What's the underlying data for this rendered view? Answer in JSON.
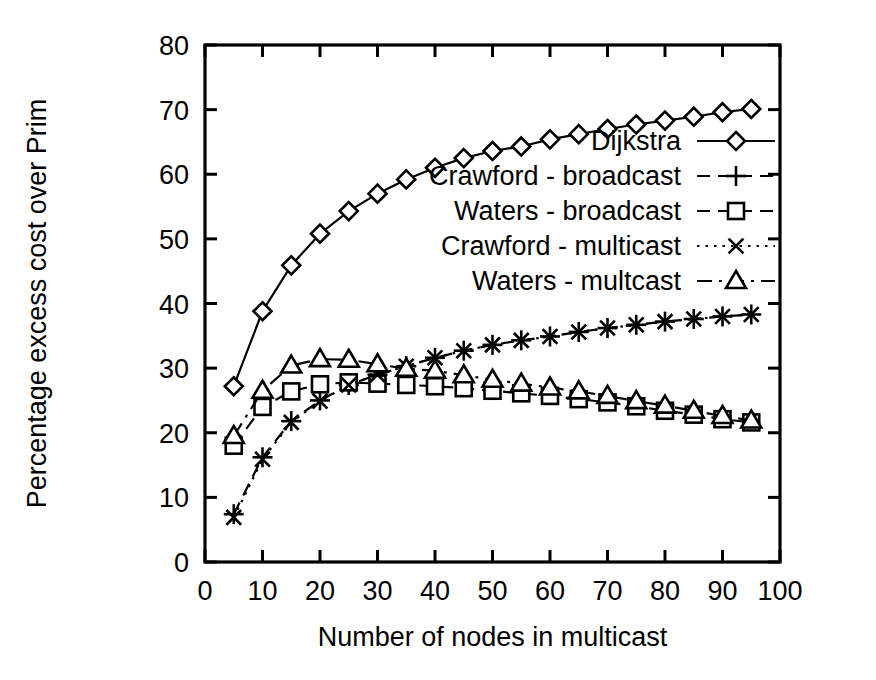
{
  "chart_data": {
    "type": "line",
    "title": "",
    "subtitle": "",
    "xlabel": "Number of nodes in multicast",
    "ylabel": "Percentage excess cost over Prim",
    "xlim": [
      0,
      100
    ],
    "ylim": [
      0,
      80
    ],
    "xticks": [
      0,
      10,
      20,
      30,
      40,
      50,
      60,
      70,
      80,
      90,
      100
    ],
    "yticks": [
      0,
      10,
      20,
      30,
      40,
      50,
      60,
      70,
      80
    ],
    "xtick_labels": [
      "0",
      "10",
      "20",
      "30",
      "40",
      "50",
      "60",
      "70",
      "80",
      "90",
      "100"
    ],
    "ytick_labels": [
      "0",
      "10",
      "20",
      "30",
      "40",
      "50",
      "60",
      "70",
      "80"
    ],
    "grid": false,
    "legend_position": "upper-right-inside",
    "x": [
      5,
      10,
      15,
      20,
      25,
      30,
      35,
      40,
      45,
      50,
      55,
      60,
      65,
      70,
      75,
      80,
      85,
      90,
      95
    ],
    "series": [
      {
        "name": "Dijkstra",
        "marker": "diamond",
        "linestyle": "solid",
        "color": "#000000",
        "values": [
          27.2,
          38.8,
          45.9,
          50.8,
          54.3,
          57.0,
          59.2,
          61.0,
          62.5,
          63.6,
          64.3,
          65.4,
          66.2,
          67.0,
          67.7,
          68.3,
          68.9,
          69.6,
          70.1
        ]
      },
      {
        "name": "Crawford - broadcast",
        "marker": "plus",
        "linestyle": "dashed",
        "color": "#000000",
        "values": [
          7.4,
          16.2,
          21.8,
          25.0,
          27.4,
          29.0,
          30.3,
          31.6,
          32.7,
          33.6,
          34.3,
          34.9,
          35.6,
          36.2,
          36.7,
          37.2,
          37.6,
          38.0,
          38.3
        ]
      },
      {
        "name": "Waters - broadcast",
        "marker": "square",
        "linestyle": "dashed",
        "color": "#000000",
        "values": [
          18.0,
          24.0,
          26.4,
          27.5,
          27.8,
          27.6,
          27.4,
          27.2,
          26.9,
          26.5,
          26.1,
          25.7,
          25.2,
          24.7,
          24.1,
          23.4,
          22.8,
          22.1,
          21.6
        ]
      },
      {
        "name": "Crawford - multicast",
        "marker": "cross",
        "linestyle": "dotted",
        "color": "#000000",
        "values": [
          6.9,
          15.9,
          21.6,
          24.9,
          27.4,
          29.0,
          30.3,
          31.6,
          32.7,
          33.6,
          34.3,
          34.9,
          35.6,
          36.2,
          36.7,
          37.2,
          37.6,
          38.0,
          38.3
        ]
      },
      {
        "name": "Waters - multcast",
        "marker": "triangle",
        "linestyle": "dashdot",
        "color": "#000000",
        "values": [
          19.5,
          26.5,
          30.4,
          31.4,
          31.3,
          30.6,
          29.9,
          29.6,
          28.9,
          28.2,
          27.6,
          27.0,
          26.4,
          25.7,
          24.9,
          24.2,
          23.4,
          22.6,
          21.9
        ]
      }
    ]
  }
}
